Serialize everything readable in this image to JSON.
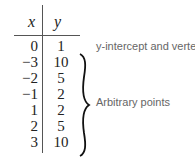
{
  "table": {
    "headers": {
      "x": "x",
      "y": "y"
    },
    "rows": [
      {
        "x": "0",
        "y": "1"
      },
      {
        "x": "−3",
        "y": "10"
      },
      {
        "x": "−2",
        "y": "5"
      },
      {
        "x": "−1",
        "y": "2"
      },
      {
        "x": "1",
        "y": "2"
      },
      {
        "x": "2",
        "y": "5"
      },
      {
        "x": "3",
        "y": "10"
      }
    ]
  },
  "annotations": {
    "vertex_note": "y-intercept and vertex",
    "arbitrary_note": "Arbitrary points"
  }
}
